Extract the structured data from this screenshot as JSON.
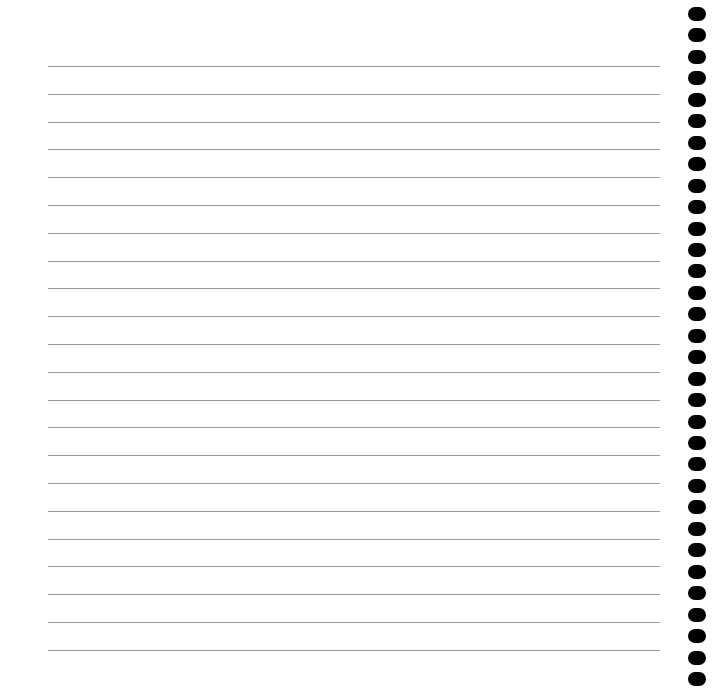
{
  "page": {
    "type": "lined-notebook-page",
    "paper_color": "#ffffff",
    "rule_color": "#9a9a9a",
    "hole_color": "#000000",
    "rules": {
      "count": 22,
      "first_y": 66,
      "spacing": 27.8,
      "left": 48,
      "right": 660
    },
    "binding_holes": {
      "count": 32,
      "first_center_y": 14,
      "spacing": 21.45,
      "center_x": 697
    }
  }
}
